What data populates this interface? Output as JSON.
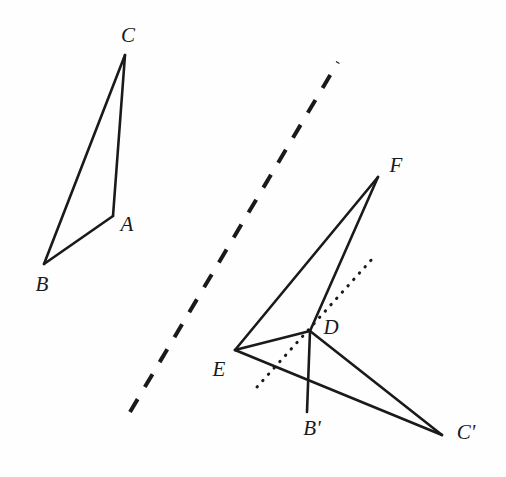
{
  "figure": {
    "width": 506,
    "height": 477,
    "background_color": "#fefefe",
    "ink_color": "#1a1a1a"
  },
  "chart_data": {
    "type": "diagram",
    "points": [
      {
        "label": "A",
        "x": 113,
        "y": 216
      },
      {
        "label": "B",
        "x": 44,
        "y": 264
      },
      {
        "label": "C",
        "x": 125,
        "y": 55
      },
      {
        "label": "D",
        "x": 310,
        "y": 331
      },
      {
        "label": "E",
        "x": 235,
        "y": 350
      },
      {
        "label": "F",
        "x": 378,
        "y": 177
      },
      {
        "label": "B'",
        "x": 307,
        "y": 412
      },
      {
        "label": "C'",
        "x": 442,
        "y": 435
      }
    ],
    "segments": [
      {
        "name": "segment-A-C",
        "from": "A",
        "to": "C",
        "style": "solid"
      },
      {
        "name": "segment-C-B",
        "from": "C",
        "to": "B",
        "style": "solid"
      },
      {
        "name": "segment-B-A",
        "from": "B",
        "to": "A",
        "style": "solid"
      },
      {
        "name": "segment-E-F",
        "from": "E",
        "to": "F",
        "style": "solid"
      },
      {
        "name": "segment-F-D",
        "from": "F",
        "to": "D",
        "style": "solid"
      },
      {
        "name": "segment-D-E",
        "from": "D",
        "to": "E",
        "style": "solid"
      },
      {
        "name": "segment-D-Bp",
        "from": "D",
        "to": "B'",
        "style": "solid"
      },
      {
        "name": "segment-D-Cp",
        "from": "D",
        "to": "C'",
        "style": "solid"
      },
      {
        "name": "segment-E-Cp",
        "from": "E",
        "to": "C'",
        "style": "solid"
      }
    ],
    "mirror_line": {
      "name": "mirror-line",
      "style": "dashed",
      "x1": 130,
      "y1": 412,
      "x2": 338,
      "y2": 62
    },
    "auxiliary_line": {
      "name": "auxiliary-dotted-line",
      "style": "dotted",
      "x1": 257,
      "y1": 387,
      "x2": 373,
      "y2": 258
    }
  },
  "labels": [
    {
      "name": "label-C",
      "text": "C",
      "x": 128,
      "y": 35
    },
    {
      "name": "label-A",
      "text": "A",
      "x": 127,
      "y": 224
    },
    {
      "name": "label-B",
      "text": "B",
      "x": 42,
      "y": 284
    },
    {
      "name": "label-F",
      "text": "F",
      "x": 396,
      "y": 165
    },
    {
      "name": "label-D",
      "text": "D",
      "x": 331,
      "y": 327
    },
    {
      "name": "label-E",
      "text": "E",
      "x": 219,
      "y": 369
    },
    {
      "name": "label-Bp",
      "text": "B'",
      "x": 312,
      "y": 428
    },
    {
      "name": "label-Cp",
      "text": "C'",
      "x": 466,
      "y": 432
    }
  ]
}
